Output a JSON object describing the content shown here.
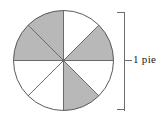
{
  "figure": {
    "background_color": "#ffffff",
    "width": 167,
    "height": 118
  },
  "pie": {
    "center_x": 63.5,
    "center_y": 60.5,
    "radius": 50,
    "slice_count": 8,
    "slice_angle_degrees": 45,
    "shaded_count": 4,
    "unshaded_count": 4,
    "fraction_shaded": "4/8",
    "shaded_color": "#b8b8b8",
    "unshaded_color": "#ffffff",
    "outline_color": "#5a5a5a",
    "outline_width": 1,
    "slices": [
      {
        "index": 0,
        "start_deg": 0,
        "end_deg": 45,
        "clock_position": "12:00-1:30",
        "shaded": false
      },
      {
        "index": 1,
        "start_deg": 45,
        "end_deg": 90,
        "clock_position": "1:30-3:00",
        "shaded": true
      },
      {
        "index": 2,
        "start_deg": 90,
        "end_deg": 135,
        "clock_position": "3:00-4:30",
        "shaded": false
      },
      {
        "index": 3,
        "start_deg": 135,
        "end_deg": 180,
        "clock_position": "4:30-6:00",
        "shaded": true
      },
      {
        "index": 4,
        "start_deg": 180,
        "end_deg": 225,
        "clock_position": "6:00-7:30",
        "shaded": false
      },
      {
        "index": 5,
        "start_deg": 225,
        "end_deg": 270,
        "clock_position": "7:30-9:00",
        "shaded": false
      },
      {
        "index": 6,
        "start_deg": 270,
        "end_deg": 315,
        "clock_position": "9:00-10:30",
        "shaded": true
      },
      {
        "index": 7,
        "start_deg": 315,
        "end_deg": 360,
        "clock_position": "10:30-12:00",
        "shaded": true
      }
    ]
  },
  "bracket": {
    "label": "1 pie",
    "color": "#6e6e6e",
    "line_width": 1,
    "x_spine": 124,
    "x_arm_end": 117,
    "y_top": 12,
    "y_bottom": 110,
    "tick_y": 60,
    "tick_x_end": 131
  }
}
